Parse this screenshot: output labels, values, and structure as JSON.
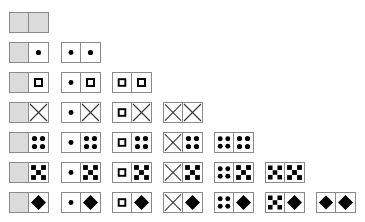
{
  "symbols": {
    "0": "blank",
    "1": "dot",
    "2": "hollow-square",
    "3": "cross",
    "4": "four-dots",
    "5": "five-squares",
    "6": "diamond"
  },
  "colors": {
    "border": "#8a8a8a",
    "blank_fill": "#dcdcdc",
    "glyph": "#000000"
  },
  "rows": [
    [
      [
        0,
        0
      ]
    ],
    [
      [
        0,
        1
      ],
      [
        1,
        1
      ]
    ],
    [
      [
        0,
        2
      ],
      [
        1,
        2
      ],
      [
        2,
        2
      ]
    ],
    [
      [
        0,
        3
      ],
      [
        1,
        3
      ],
      [
        2,
        3
      ],
      [
        3,
        3
      ]
    ],
    [
      [
        0,
        4
      ],
      [
        1,
        4
      ],
      [
        2,
        4
      ],
      [
        3,
        4
      ],
      [
        4,
        4
      ]
    ],
    [
      [
        0,
        5
      ],
      [
        1,
        5
      ],
      [
        2,
        5
      ],
      [
        3,
        5
      ],
      [
        4,
        5
      ],
      [
        5,
        5
      ]
    ],
    [
      [
        0,
        6
      ],
      [
        1,
        6
      ],
      [
        2,
        6
      ],
      [
        3,
        6
      ],
      [
        4,
        6
      ],
      [
        5,
        6
      ],
      [
        6,
        6
      ]
    ]
  ]
}
